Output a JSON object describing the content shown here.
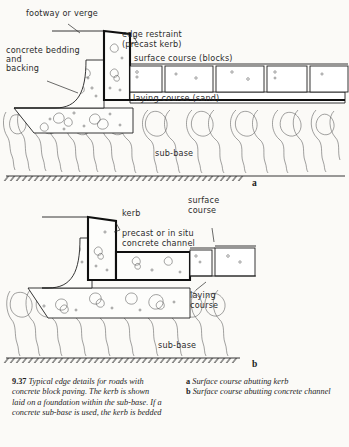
{
  "figure": {
    "number": "9.37",
    "title": "Typical edge details for roads with concrete block paving. The kerb is shown laid on a foundation within the sub-base. If a concrete sub-base is used, the kerb is bedded",
    "key": [
      {
        "marker": "a",
        "text": "Surface course abutting kerb"
      },
      {
        "marker": "b",
        "text": "Surface course abutting concrete channel"
      }
    ]
  },
  "diagram_a": {
    "marker": "a",
    "labels": {
      "footway": "footway or verge",
      "bedding": "concrete bedding\nand\nbacking",
      "bedding_l1": "concrete bedding",
      "bedding_l2": "and",
      "bedding_l3": "backing",
      "edge_restraint_l1": "edge restraint",
      "edge_restraint_l2": "(precast kerb)",
      "surface_course": "surface course (blocks)",
      "laying_course": "laying course (sand)",
      "sub_base": "sub-base"
    }
  },
  "diagram_b": {
    "marker": "b",
    "labels": {
      "kerb": "kerb",
      "channel_l1": "precast or in situ",
      "channel_l2": "concrete channel",
      "surface_course_l1": "surface",
      "surface_course_l2": "course",
      "laying_course_l1": "laying",
      "laying_course_l2": "course",
      "sub_base": "sub-base"
    }
  },
  "colors": {
    "paper": "#fbfaf7",
    "ink": "#1f1f1f",
    "ink_bold": "#0f0f0f",
    "aggregate": "#555555"
  }
}
